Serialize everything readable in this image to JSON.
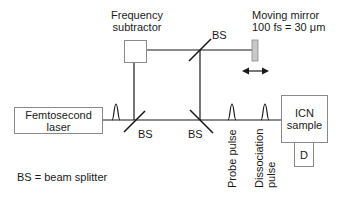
{
  "diagram": {
    "components": {
      "laser": {
        "line1": "Femtosecond",
        "line2": "laser"
      },
      "frequency_subtractor": {
        "line1": "Frequency",
        "line2": "subtractor"
      },
      "moving_mirror": {
        "line1": "Moving mirror",
        "line2": "100 fs = 30 μm"
      },
      "sample": {
        "line1": "ICN",
        "line2": "sample"
      },
      "detector": {
        "label": "D"
      }
    },
    "beam_splitters": [
      {
        "label": "BS",
        "position": "lower-left"
      },
      {
        "label": "BS",
        "position": "lower-middle"
      },
      {
        "label": "BS",
        "position": "top"
      }
    ],
    "pulses": {
      "probe": "Probe pulse",
      "dissociation_line1": "Dissociation",
      "dissociation_line2": "pulse"
    },
    "legend": "BS = beam splitter",
    "colors": {
      "line": "#1a1a1a",
      "box_border": "#8a8a8a",
      "mirror_fill": "#c8c8c8"
    }
  }
}
